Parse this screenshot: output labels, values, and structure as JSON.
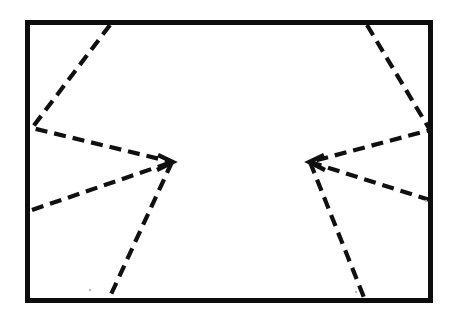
{
  "figure": {
    "background_color": "#ffffff",
    "stroke_color": "#101010",
    "frame_color": "#0d0d0d",
    "canvas": {
      "width": 458,
      "height": 322
    }
  },
  "frame": {
    "name": "outer-rectangle",
    "x": 25,
    "y": 20,
    "width": 408,
    "height": 283,
    "stroke_width": 5,
    "style": "solid"
  },
  "dash_pattern": {
    "dash_length": 12,
    "gap_length": 7,
    "stroke_width": 4.2,
    "style": "dashed"
  },
  "shapes": [
    {
      "name": "left-chevron-upper-arm",
      "points": "110,25 32,128 172,162",
      "dasharray": "12 7"
    },
    {
      "name": "left-chevron-lower-arm",
      "points": "32,210 172,162",
      "dasharray": "12 7"
    },
    {
      "name": "left-chevron-tail",
      "points": "172,162 108,301",
      "dasharray": "12 7"
    },
    {
      "name": "right-chevron-upper-arm",
      "points": "367,25 430,130 310,162",
      "dasharray": "12 7"
    },
    {
      "name": "right-chevron-lower-arm",
      "points": "430,200 310,162",
      "dasharray": "12 7"
    },
    {
      "name": "right-chevron-tail",
      "points": "310,162 365,300",
      "dasharray": "12 7"
    }
  ],
  "vertices": [
    {
      "name": "left-chevron-apex",
      "x": 172,
      "y": 162,
      "glyph": ">"
    },
    {
      "name": "right-chevron-apex",
      "x": 310,
      "y": 162,
      "glyph": "<"
    }
  ],
  "chart_data": {
    "type": "line",
    "xlabel": "",
    "ylabel": "",
    "xlim": [
      0,
      458
    ],
    "ylim": [
      322,
      0
    ],
    "grid": false,
    "legend": "none",
    "series": [
      {
        "name": "left-chevron-upper-arm",
        "x": [
          110,
          32,
          172
        ],
        "y": [
          25,
          128,
          162
        ],
        "linestyle": "dashed",
        "color": "#101010"
      },
      {
        "name": "left-chevron-lower-arm",
        "x": [
          32,
          172
        ],
        "y": [
          210,
          162
        ],
        "linestyle": "dashed",
        "color": "#101010"
      },
      {
        "name": "left-chevron-tail",
        "x": [
          172,
          108
        ],
        "y": [
          162,
          301
        ],
        "linestyle": "dashed",
        "color": "#101010"
      },
      {
        "name": "right-chevron-upper-arm",
        "x": [
          367,
          430,
          310
        ],
        "y": [
          25,
          130,
          162
        ],
        "linestyle": "dashed",
        "color": "#101010"
      },
      {
        "name": "right-chevron-lower-arm",
        "x": [
          430,
          310
        ],
        "y": [
          200,
          162
        ],
        "linestyle": "dashed",
        "color": "#101010"
      },
      {
        "name": "right-chevron-tail",
        "x": [
          310,
          365
        ],
        "y": [
          162,
          300
        ],
        "linestyle": "dashed",
        "color": "#101010"
      }
    ],
    "annotations": []
  }
}
